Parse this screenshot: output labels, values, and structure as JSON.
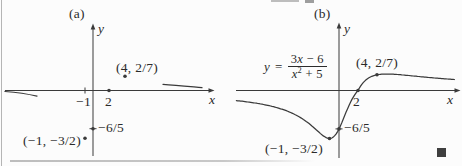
{
  "figure": {
    "ink_color": "#3a3a3a",
    "end_marker_color": "#3f3f3f",
    "panel_a": {
      "label": "(a)",
      "axis": {
        "x_label": "x",
        "y_label": "y"
      },
      "tick_labels": {
        "neg1": "−1",
        "two": "2"
      },
      "point_labels": {
        "p_4_27": "(4, 2/7)",
        "y_intercept": "−6/5",
        "min_point": "(−1, −3/2)"
      }
    },
    "panel_b": {
      "label": "(b)",
      "axis": {
        "x_label": "x",
        "y_label": "y"
      },
      "tick_labels": {
        "two": "2"
      },
      "point_labels": {
        "p_4_27": "(4, 2/7)",
        "y_intercept": "−6/5",
        "min_point": "(−1, −3/2)"
      },
      "equation": {
        "lhs_var": "y",
        "equals": "=",
        "num_coeff": "3",
        "num_var": "x",
        "num_rest": " − 6",
        "den_var": "x",
        "den_power": "2",
        "den_rest": " + 5"
      }
    }
  },
  "chart_data": [
    {
      "type": "scatter",
      "panel": "(a)",
      "title": "(a)",
      "xlabel": "x",
      "ylabel": "y",
      "points": [
        {
          "x": -1,
          "y": -1.5,
          "label": "(−1, −3/2)"
        },
        {
          "x": 0,
          "y": -1.2,
          "label": "−6/5"
        },
        {
          "x": 2,
          "y": 0,
          "label": "2"
        },
        {
          "x": 4,
          "y": 0.2857,
          "label": "(4, 2/7)"
        }
      ],
      "x_ticks": [
        -1,
        2
      ],
      "annotations": [
        "short curve fragments sketched near y = 0 as x → −∞ (below axis) and x → +∞ (above axis)"
      ],
      "grid": false,
      "legend": "none"
    },
    {
      "type": "line",
      "panel": "(b)",
      "title": "(b)",
      "equation": "y = (3x − 6)/(x² + 5)",
      "xlabel": "x",
      "ylabel": "y",
      "x": [
        -10,
        -8,
        -6,
        -4,
        -3,
        -2,
        -1,
        0,
        1,
        2,
        3,
        4,
        5,
        6,
        8,
        10,
        12
      ],
      "y": [
        -0.343,
        -0.435,
        -0.585,
        -0.857,
        -1.071,
        -1.333,
        -1.5,
        -1.2,
        -0.5,
        0,
        0.214,
        0.286,
        0.3,
        0.293,
        0.261,
        0.229,
        0.201
      ],
      "labeled_points": [
        {
          "x": -1,
          "y": -1.5,
          "label": "(−1, −3/2)"
        },
        {
          "x": 0,
          "y": -1.2,
          "label": "−6/5"
        },
        {
          "x": 2,
          "y": 0,
          "label": "2"
        },
        {
          "x": 4,
          "y": 0.2857,
          "label": "(4, 2/7)"
        }
      ],
      "x_ticks": [
        2
      ],
      "grid": false,
      "legend": "none"
    }
  ]
}
